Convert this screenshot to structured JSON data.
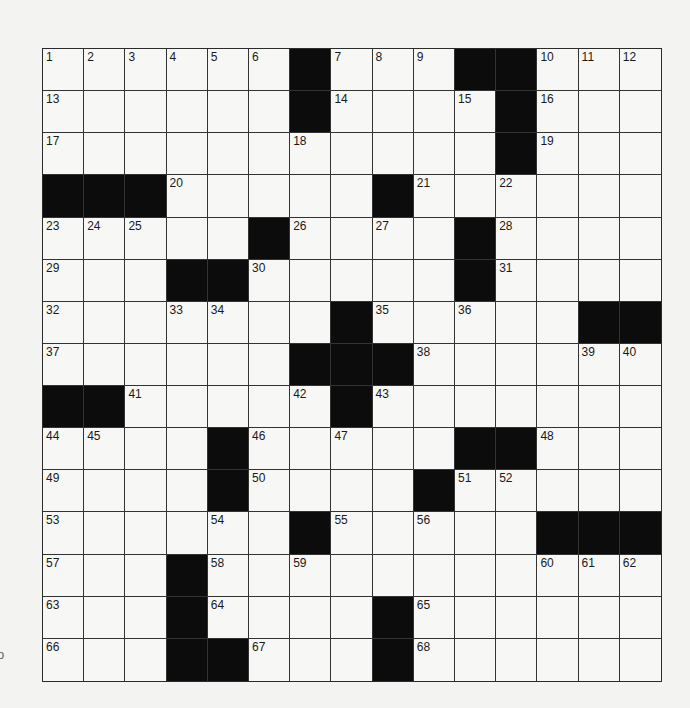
{
  "puzzle": {
    "rows": 15,
    "cols": 15,
    "layout": [
      "######.###..###",
      "######.####.###",
      "###########.###",
      "...#####.######",
      "#####.####.####",
      "###..#####.####",
      "#######.#####..",
      "######...######",
      "..#####.#######",
      "####.#####..###",
      "####.####.#####",
      "######.#####...",
      "###.###########",
      "###.####.######",
      "###..###.######"
    ],
    "layout_legend": {
      "#": "white",
      ".": "black"
    },
    "numbers": [
      {
        "r": 0,
        "c": 0,
        "n": "1"
      },
      {
        "r": 0,
        "c": 1,
        "n": "2"
      },
      {
        "r": 0,
        "c": 2,
        "n": "3"
      },
      {
        "r": 0,
        "c": 3,
        "n": "4"
      },
      {
        "r": 0,
        "c": 4,
        "n": "5"
      },
      {
        "r": 0,
        "c": 5,
        "n": "6"
      },
      {
        "r": 0,
        "c": 7,
        "n": "7"
      },
      {
        "r": 0,
        "c": 8,
        "n": "8"
      },
      {
        "r": 0,
        "c": 9,
        "n": "9"
      },
      {
        "r": 0,
        "c": 12,
        "n": "10"
      },
      {
        "r": 0,
        "c": 13,
        "n": "11"
      },
      {
        "r": 0,
        "c": 14,
        "n": "12"
      },
      {
        "r": 1,
        "c": 0,
        "n": "13"
      },
      {
        "r": 1,
        "c": 7,
        "n": "14"
      },
      {
        "r": 1,
        "c": 10,
        "n": "15"
      },
      {
        "r": 1,
        "c": 12,
        "n": "16"
      },
      {
        "r": 2,
        "c": 0,
        "n": "17"
      },
      {
        "r": 2,
        "c": 6,
        "n": "18"
      },
      {
        "r": 2,
        "c": 12,
        "n": "19"
      },
      {
        "r": 3,
        "c": 3,
        "n": "20"
      },
      {
        "r": 3,
        "c": 9,
        "n": "21"
      },
      {
        "r": 3,
        "c": 11,
        "n": "22"
      },
      {
        "r": 4,
        "c": 0,
        "n": "23"
      },
      {
        "r": 4,
        "c": 1,
        "n": "24"
      },
      {
        "r": 4,
        "c": 2,
        "n": "25"
      },
      {
        "r": 4,
        "c": 6,
        "n": "26"
      },
      {
        "r": 4,
        "c": 8,
        "n": "27"
      },
      {
        "r": 4,
        "c": 11,
        "n": "28"
      },
      {
        "r": 5,
        "c": 0,
        "n": "29"
      },
      {
        "r": 5,
        "c": 5,
        "n": "30"
      },
      {
        "r": 5,
        "c": 11,
        "n": "31"
      },
      {
        "r": 6,
        "c": 0,
        "n": "32"
      },
      {
        "r": 6,
        "c": 3,
        "n": "33"
      },
      {
        "r": 6,
        "c": 4,
        "n": "34"
      },
      {
        "r": 6,
        "c": 8,
        "n": "35"
      },
      {
        "r": 6,
        "c": 10,
        "n": "36"
      },
      {
        "r": 7,
        "c": 0,
        "n": "37"
      },
      {
        "r": 7,
        "c": 9,
        "n": "38"
      },
      {
        "r": 7,
        "c": 13,
        "n": "39"
      },
      {
        "r": 7,
        "c": 14,
        "n": "40"
      },
      {
        "r": 8,
        "c": 2,
        "n": "41"
      },
      {
        "r": 8,
        "c": 6,
        "n": "42"
      },
      {
        "r": 8,
        "c": 8,
        "n": "43"
      },
      {
        "r": 9,
        "c": 0,
        "n": "44"
      },
      {
        "r": 9,
        "c": 1,
        "n": "45"
      },
      {
        "r": 9,
        "c": 5,
        "n": "46"
      },
      {
        "r": 9,
        "c": 7,
        "n": "47"
      },
      {
        "r": 9,
        "c": 12,
        "n": "48"
      },
      {
        "r": 10,
        "c": 0,
        "n": "49"
      },
      {
        "r": 10,
        "c": 5,
        "n": "50"
      },
      {
        "r": 10,
        "c": 10,
        "n": "51"
      },
      {
        "r": 10,
        "c": 11,
        "n": "52"
      },
      {
        "r": 11,
        "c": 0,
        "n": "53"
      },
      {
        "r": 11,
        "c": 4,
        "n": "54"
      },
      {
        "r": 11,
        "c": 7,
        "n": "55"
      },
      {
        "r": 11,
        "c": 9,
        "n": "56"
      },
      {
        "r": 12,
        "c": 0,
        "n": "57"
      },
      {
        "r": 12,
        "c": 4,
        "n": "58"
      },
      {
        "r": 12,
        "c": 6,
        "n": "59"
      },
      {
        "r": 12,
        "c": 12,
        "n": "60"
      },
      {
        "r": 12,
        "c": 13,
        "n": "61"
      },
      {
        "r": 12,
        "c": 14,
        "n": "62"
      },
      {
        "r": 13,
        "c": 0,
        "n": "63"
      },
      {
        "r": 13,
        "c": 4,
        "n": "64"
      },
      {
        "r": 13,
        "c": 9,
        "n": "65"
      },
      {
        "r": 14,
        "c": 0,
        "n": "66"
      },
      {
        "r": 14,
        "c": 5,
        "n": "67"
      },
      {
        "r": 14,
        "c": 9,
        "n": "68"
      }
    ]
  },
  "margin": {
    "partial_glyph": "o"
  },
  "colors": {
    "page_background": "#f3f3f1",
    "cell_white": "#f7f7f5",
    "cell_black": "#0c0c0c",
    "grid_line": "#333333"
  }
}
